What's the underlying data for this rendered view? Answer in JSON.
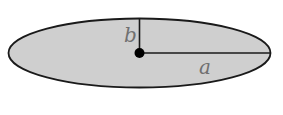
{
  "diagram": {
    "shape": "ellipse",
    "fill_color": "#cfcfcf",
    "stroke_color": "#1a1a1a",
    "labels": {
      "semi_minor": "b",
      "semi_major": "a"
    }
  }
}
